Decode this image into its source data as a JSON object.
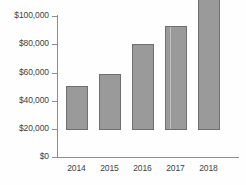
{
  "chart_data": {
    "type": "bar",
    "title": "",
    "subtitle": "",
    "xlabel": "",
    "ylabel": "",
    "categories": [
      "2014",
      "2015",
      "2016",
      "2017",
      "2018"
    ],
    "values": [
      31000,
      40000,
      61000,
      74000,
      93500
    ],
    "ylim": [
      0,
      100000
    ],
    "yticks": [
      0,
      20000,
      40000,
      60000,
      80000,
      100000
    ],
    "ytick_labels": [
      "$0",
      "$20,000",
      "$40,000",
      "$60,000",
      "$80,000",
      "$100,000"
    ],
    "grid": false,
    "legend": null,
    "series": [
      {
        "name": "",
        "values": [
          31000,
          40000,
          61000,
          74000,
          93500
        ]
      }
    ],
    "colors": {
      "bar_fill": "#9a9a9a",
      "bar_edge": "#6f6f6f",
      "axis": "#8d8d8d",
      "text": "#3f3f3f",
      "background": "#fefefe"
    }
  }
}
